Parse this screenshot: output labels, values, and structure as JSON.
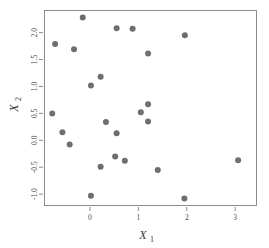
{
  "chart_data": {
    "type": "scatter",
    "title": "",
    "xlabel": "X1",
    "ylabel": "X2",
    "xlabel_base": "X",
    "xlabel_subscript": "1",
    "ylabel_base": "X",
    "ylabel_subscript": "2",
    "xlim": [
      -0.95,
      3.45
    ],
    "ylim": [
      -1.22,
      2.42
    ],
    "xticks": [
      0,
      1,
      2,
      3
    ],
    "xtick_labels": [
      "0",
      "1",
      "2",
      "3"
    ],
    "yticks": [
      -1.0,
      -0.5,
      0.0,
      0.5,
      1.0,
      1.5,
      2.0
    ],
    "ytick_labels": [
      "-1.0",
      "-0.5",
      "0.0",
      "0.5",
      "1.0",
      "1.5",
      "2.0"
    ],
    "grid": false,
    "legend": null,
    "marker": "filled-circle",
    "marker_color": "#6e6e6e",
    "marker_size": 3.0,
    "frame_color": "#8c8c8c",
    "points": [
      {
        "x": -0.15,
        "y": 2.28
      },
      {
        "x": 0.55,
        "y": 2.08
      },
      {
        "x": 0.88,
        "y": 2.07
      },
      {
        "x": 1.96,
        "y": 1.95
      },
      {
        "x": -0.72,
        "y": 1.79
      },
      {
        "x": -0.33,
        "y": 1.69
      },
      {
        "x": 1.2,
        "y": 1.61
      },
      {
        "x": 0.22,
        "y": 1.18
      },
      {
        "x": 0.02,
        "y": 1.02
      },
      {
        "x": 1.2,
        "y": 0.67
      },
      {
        "x": -0.78,
        "y": 0.5
      },
      {
        "x": 1.05,
        "y": 0.52
      },
      {
        "x": 0.33,
        "y": 0.34
      },
      {
        "x": 1.2,
        "y": 0.35
      },
      {
        "x": -0.57,
        "y": 0.15
      },
      {
        "x": 0.55,
        "y": 0.13
      },
      {
        "x": -0.42,
        "y": -0.08
      },
      {
        "x": 0.52,
        "y": -0.3
      },
      {
        "x": 0.72,
        "y": -0.38
      },
      {
        "x": 0.22,
        "y": -0.49
      },
      {
        "x": 1.4,
        "y": -0.55
      },
      {
        "x": 3.06,
        "y": -0.37
      },
      {
        "x": 0.02,
        "y": -1.03
      },
      {
        "x": 1.95,
        "y": -1.08
      }
    ]
  },
  "layout": {
    "plot_area": {
      "left": 44,
      "top": 10,
      "right": 257,
      "bottom": 206
    },
    "background": "#ffffff"
  }
}
